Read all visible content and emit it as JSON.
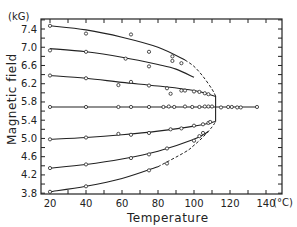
{
  "chart_data": {
    "type": "line",
    "title": "",
    "xlabel": "Temperature",
    "ylabel": "Magnetic field",
    "x_unit": "(°C)",
    "y_unit": "(kG)",
    "xlim": [
      15,
      149
    ],
    "ylim": [
      3.8,
      7.62
    ],
    "x_ticks": [
      20,
      40,
      60,
      80,
      100,
      120,
      140
    ],
    "x_tick_labels": [
      "20",
      "40",
      "60",
      "80",
      "100",
      "120",
      "140"
    ],
    "y_ticks": [
      3.8,
      4.2,
      4.6,
      5.0,
      5.4,
      5.8,
      6.2,
      6.6,
      7.0,
      7.4
    ],
    "y_tick_labels": [
      "3.8",
      "4.2",
      "4.6",
      "5.0",
      "5.4",
      "5.8",
      "6.2",
      "6.6",
      "7.0",
      "7.4"
    ],
    "grid": false,
    "legend": null,
    "series": [
      {
        "name": "curve-1",
        "fit_line": [
          [
            20,
            7.47
          ],
          [
            40,
            7.38
          ],
          [
            60,
            7.22
          ],
          [
            80,
            7.0
          ],
          [
            95,
            6.72
          ],
          [
            100,
            6.58
          ],
          [
            105,
            6.36
          ],
          [
            110,
            6.08
          ],
          [
            112,
            5.93
          ]
        ],
        "dashed_from": 98,
        "points": [
          [
            20,
            7.47
          ],
          [
            40,
            7.3
          ],
          [
            65,
            7.28
          ],
          [
            75,
            6.9
          ],
          [
            88,
            6.8
          ]
        ]
      },
      {
        "name": "curve-2",
        "fit_line": [
          [
            20,
            6.97
          ],
          [
            40,
            6.9
          ],
          [
            60,
            6.78
          ],
          [
            80,
            6.62
          ],
          [
            90,
            6.52
          ],
          [
            100,
            6.34
          ]
        ],
        "points": [
          [
            20,
            6.93
          ],
          [
            40,
            6.9
          ],
          [
            62,
            6.75
          ],
          [
            75,
            6.58
          ],
          [
            88,
            6.7
          ],
          [
            93,
            6.65
          ]
        ],
        "note": "joins dashed upper branch near 100 °C"
      },
      {
        "name": "curve-3",
        "fit_line": [
          [
            20,
            6.38
          ],
          [
            40,
            6.32
          ],
          [
            60,
            6.23
          ],
          [
            80,
            6.15
          ],
          [
            100,
            6.05
          ],
          [
            112,
            5.92
          ]
        ],
        "points": [
          [
            20,
            6.38
          ],
          [
            40,
            6.32
          ],
          [
            58,
            6.17
          ],
          [
            65,
            6.24
          ],
          [
            75,
            6.16
          ],
          [
            85,
            6.1
          ],
          [
            87,
            5.98
          ],
          [
            93,
            6.05
          ],
          [
            95,
            6.05
          ],
          [
            100,
            6.03
          ],
          [
            103,
            6.02
          ],
          [
            106,
            5.99
          ],
          [
            108,
            5.97
          ]
        ]
      },
      {
        "name": "curve-4 (horizontal)",
        "fit_line": [
          [
            20,
            5.69
          ],
          [
            135,
            5.69
          ]
        ],
        "points": [
          [
            20,
            5.69
          ],
          [
            40,
            5.69
          ],
          [
            58,
            5.69
          ],
          [
            65,
            5.69
          ],
          [
            75,
            5.69
          ],
          [
            83,
            5.69
          ],
          [
            86,
            5.7
          ],
          [
            89,
            5.69
          ],
          [
            95,
            5.7
          ],
          [
            99,
            5.69
          ],
          [
            103,
            5.69
          ],
          [
            106,
            5.7
          ],
          [
            108,
            5.7
          ],
          [
            110,
            5.7
          ],
          [
            115,
            5.68
          ],
          [
            119,
            5.69
          ],
          [
            121,
            5.69
          ],
          [
            124,
            5.68
          ],
          [
            126,
            5.68
          ],
          [
            135,
            5.69
          ]
        ]
      },
      {
        "name": "curve-5",
        "fit_line": [
          [
            20,
            4.98
          ],
          [
            40,
            5.02
          ],
          [
            60,
            5.08
          ],
          [
            80,
            5.16
          ],
          [
            100,
            5.27
          ],
          [
            112,
            5.37
          ]
        ],
        "points": [
          [
            20,
            4.98
          ],
          [
            40,
            5.02
          ],
          [
            58,
            5.1
          ],
          [
            65,
            5.08
          ],
          [
            75,
            5.12
          ],
          [
            87,
            5.2
          ],
          [
            93,
            5.22
          ],
          [
            100,
            5.28
          ],
          [
            105,
            5.31
          ],
          [
            108,
            5.34
          ],
          [
            109,
            5.36
          ]
        ]
      },
      {
        "name": "curve-6",
        "fit_line": [
          [
            20,
            4.35
          ],
          [
            40,
            4.43
          ],
          [
            60,
            4.55
          ],
          [
            80,
            4.72
          ],
          [
            100,
            4.98
          ],
          [
            108,
            5.15
          ]
        ],
        "points": [
          [
            20,
            4.35
          ],
          [
            40,
            4.43
          ],
          [
            65,
            4.57
          ],
          [
            75,
            4.65
          ],
          [
            85,
            4.78
          ],
          [
            100,
            4.95
          ],
          [
            103,
            5.05
          ],
          [
            105,
            5.12
          ]
        ]
      },
      {
        "name": "curve-7",
        "fit_line": [
          [
            20,
            3.83
          ],
          [
            40,
            3.95
          ],
          [
            60,
            4.12
          ],
          [
            80,
            4.38
          ],
          [
            95,
            4.7
          ],
          [
            100,
            4.85
          ],
          [
            105,
            5.03
          ],
          [
            110,
            5.25
          ],
          [
            112,
            5.37
          ]
        ],
        "dashed_from": 85,
        "points": [
          [
            20,
            3.83
          ],
          [
            40,
            3.95
          ],
          [
            75,
            4.3
          ],
          [
            85,
            4.45
          ]
        ]
      },
      {
        "name": "vertical-boundary",
        "fit_line": [
          [
            112,
            5.37
          ],
          [
            112,
            5.93
          ]
        ]
      }
    ]
  }
}
